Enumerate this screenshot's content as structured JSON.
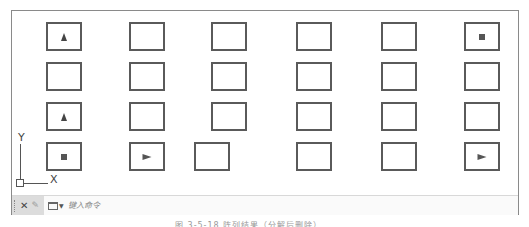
{
  "drawing": {
    "grid": {
      "columns_x": [
        34,
        117,
        199,
        284,
        369,
        452
      ],
      "rows_y": [
        11,
        51,
        91,
        131
      ],
      "box_size": {
        "width": 36,
        "height": 29
      },
      "cells": [
        {
          "row": 0,
          "col": 0,
          "mark": "triangle-up"
        },
        {
          "row": 0,
          "col": 1,
          "mark": "none"
        },
        {
          "row": 0,
          "col": 2,
          "mark": "none"
        },
        {
          "row": 0,
          "col": 3,
          "mark": "none"
        },
        {
          "row": 0,
          "col": 4,
          "mark": "none"
        },
        {
          "row": 0,
          "col": 5,
          "mark": "square"
        },
        {
          "row": 1,
          "col": 0,
          "mark": "none"
        },
        {
          "row": 1,
          "col": 1,
          "mark": "none"
        },
        {
          "row": 1,
          "col": 2,
          "mark": "none"
        },
        {
          "row": 1,
          "col": 3,
          "mark": "none"
        },
        {
          "row": 1,
          "col": 4,
          "mark": "none"
        },
        {
          "row": 1,
          "col": 5,
          "mark": "none"
        },
        {
          "row": 2,
          "col": 0,
          "mark": "triangle-up"
        },
        {
          "row": 2,
          "col": 1,
          "mark": "none"
        },
        {
          "row": 2,
          "col": 2,
          "mark": "none"
        },
        {
          "row": 2,
          "col": 3,
          "mark": "none"
        },
        {
          "row": 2,
          "col": 4,
          "mark": "none"
        },
        {
          "row": 2,
          "col": 5,
          "mark": "none"
        },
        {
          "row": 3,
          "col": 0,
          "mark": "square"
        },
        {
          "row": 3,
          "col": 1,
          "mark": "triangle-right"
        },
        {
          "row": 3,
          "col": 2,
          "mark": "none",
          "x_override": 182
        },
        {
          "row": 3,
          "col": 3,
          "mark": "none"
        },
        {
          "row": 3,
          "col": 4,
          "mark": "none"
        },
        {
          "row": 3,
          "col": 5,
          "mark": "triangle-right"
        }
      ]
    },
    "ucs": {
      "x_label": "X",
      "y_label": "Y"
    }
  },
  "command_line": {
    "close_icon": "close-icon",
    "settings_icon": "wrench-icon",
    "history_icon": "command-window-icon",
    "placeholder": "键入命令"
  },
  "caption": "图 3-5-18  阵列结果（分解后删除）"
}
